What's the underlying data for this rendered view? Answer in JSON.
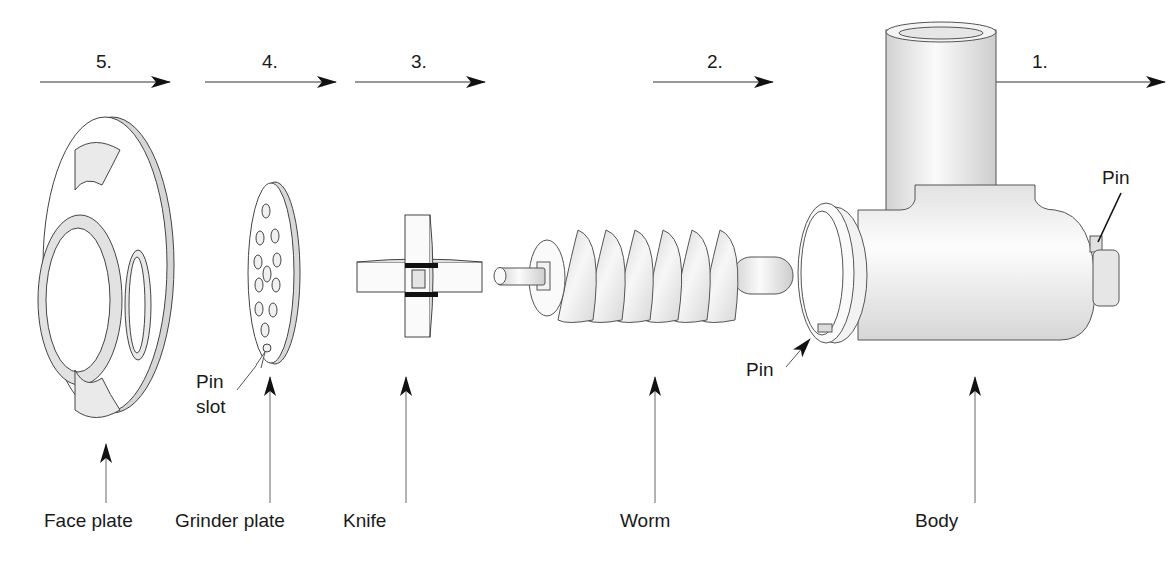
{
  "diagram": {
    "type": "exploded-assembly",
    "steps": [
      {
        "number": "5.",
        "x": 105,
        "arrow_x1": 40,
        "arrow_x2": 170
      },
      {
        "number": "4.",
        "x": 270,
        "arrow_x1": 205,
        "arrow_x2": 336
      },
      {
        "number": "3.",
        "x": 420,
        "arrow_x1": 355,
        "arrow_x2": 485
      },
      {
        "number": "2.",
        "x": 715,
        "arrow_x1": 653,
        "arrow_x2": 773
      },
      {
        "number": "1.",
        "x": 1040,
        "arrow_x1": 975,
        "arrow_x2": 1165
      }
    ],
    "parts": [
      {
        "id": "face-plate",
        "label": "Face plate"
      },
      {
        "id": "grinder-plate",
        "label": "Grinder plate"
      },
      {
        "id": "knife",
        "label": "Knife"
      },
      {
        "id": "worm",
        "label": "Worm"
      },
      {
        "id": "body",
        "label": "Body"
      }
    ],
    "callouts": [
      {
        "id": "pin-slot",
        "label_line1": "Pin",
        "label_line2": "slot"
      },
      {
        "id": "pin-inner",
        "label": "Pin"
      },
      {
        "id": "pin-rear",
        "label": "Pin"
      }
    ],
    "colors": {
      "line": "#3a3a3a",
      "arrow": "#111111",
      "fill_light": "#f4f4f4",
      "fill_shade": "#cfcfcf",
      "black_band": "#111111"
    }
  }
}
